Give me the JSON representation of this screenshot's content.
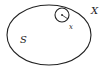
{
  "diagram": {
    "labels": {
      "set_S": "S",
      "space_X": "X",
      "point_x": "x"
    },
    "colors": {
      "stroke": "#222222",
      "background": "#ffffff"
    }
  }
}
